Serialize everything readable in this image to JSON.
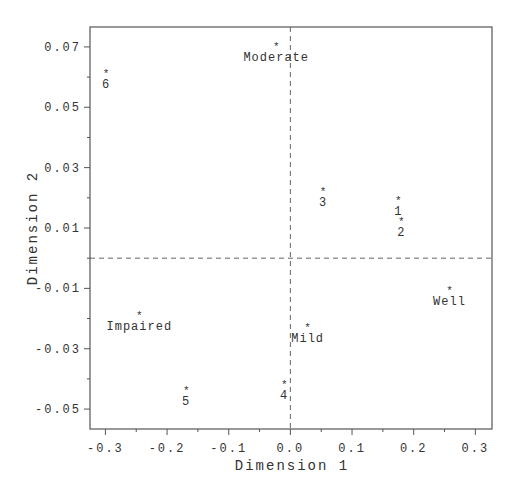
{
  "chart_data": {
    "type": "scatter",
    "title": "",
    "xlabel": "Dimension 1",
    "ylabel": "Dimension 2",
    "xlim": [
      -0.325,
      0.327
    ],
    "ylim": [
      -0.0566,
      0.0766
    ],
    "xticks": [
      -0.3,
      -0.2,
      -0.1,
      0.0,
      0.1,
      0.2,
      0.3
    ],
    "xtick_labels": [
      "-0.3",
      "-0.2",
      "-0.1",
      "0.0",
      "0.1",
      "0.2",
      "0.3"
    ],
    "xminor_ticks": [
      -0.25,
      -0.15,
      -0.05,
      0.05,
      0.15,
      0.25
    ],
    "yticks": [
      0.07,
      0.05,
      0.03,
      0.01,
      -0.01,
      -0.03,
      -0.05
    ],
    "ytick_labels": [
      "0.07",
      "0.05",
      "0.03",
      "0.01",
      "-0.01",
      "-0.03",
      "-0.05"
    ],
    "yminor_ticks": [
      0.06,
      0.04,
      0.02,
      0.0,
      -0.02,
      -0.04
    ],
    "grid": false,
    "reference_lines": {
      "x": 0.0,
      "y": 0.0,
      "style": "dashed"
    },
    "marker": "*",
    "legend": null,
    "series": [
      {
        "name": "Categories",
        "points": [
          {
            "label": "Moderate",
            "x": -0.023,
            "y": 0.071
          },
          {
            "label": "Well",
            "x": 0.258,
            "y": -0.01
          },
          {
            "label": "Mild",
            "x": 0.028,
            "y": -0.022
          },
          {
            "label": "Impaired",
            "x": -0.245,
            "y": -0.018
          }
        ]
      },
      {
        "name": "Items",
        "points": [
          {
            "label": "1",
            "x": 0.175,
            "y": 0.02
          },
          {
            "label": "2",
            "x": 0.18,
            "y": 0.013
          },
          {
            "label": "3",
            "x": 0.053,
            "y": 0.023
          },
          {
            "label": "4",
            "x": -0.01,
            "y": -0.041
          },
          {
            "label": "5",
            "x": -0.169,
            "y": -0.043
          },
          {
            "label": "6",
            "x": -0.299,
            "y": 0.062
          }
        ]
      }
    ]
  },
  "plot_area": {
    "left": 90,
    "top": 27,
    "right": 492,
    "bottom": 429
  }
}
